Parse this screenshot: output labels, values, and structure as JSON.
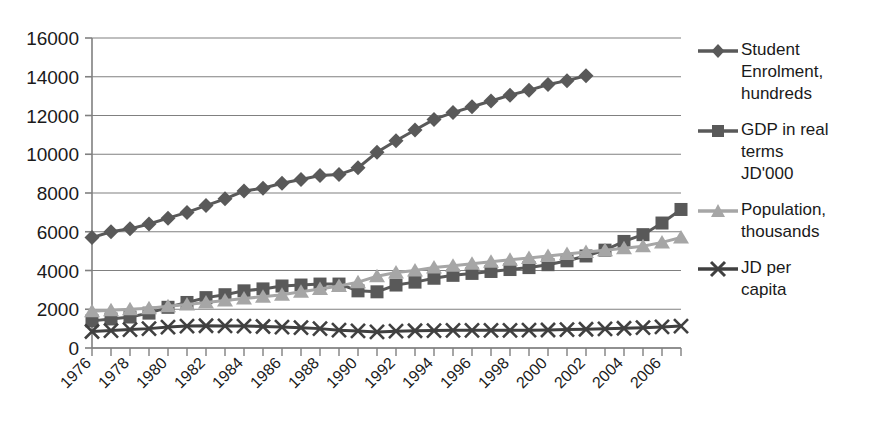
{
  "chart_data": {
    "type": "line",
    "title": "",
    "xlabel": "",
    "ylabel": "",
    "ylim": [
      0,
      16000
    ],
    "ytick_labels": [
      "16000",
      "14000",
      "12000",
      "10000",
      "8000",
      "6000",
      "4000",
      "2000",
      "0"
    ],
    "yticks": [
      16000,
      14000,
      12000,
      10000,
      8000,
      6000,
      4000,
      2000,
      0
    ],
    "grid": "horizontal",
    "legend_position": "right-outside",
    "x": [
      1976,
      1977,
      1978,
      1979,
      1980,
      1981,
      1982,
      1983,
      1984,
      1985,
      1986,
      1987,
      1988,
      1989,
      1990,
      1991,
      1992,
      1993,
      1994,
      1995,
      1996,
      1997,
      1998,
      1999,
      2000,
      2001,
      2002,
      2003,
      2004,
      2005,
      2006,
      2007
    ],
    "xtick_labels": [
      "1976",
      "",
      "1978",
      "",
      "1980",
      "",
      "1982",
      "",
      "1984",
      "",
      "1986",
      "",
      "1988",
      "",
      "1990",
      "",
      "1992",
      "",
      "1994",
      "",
      "1996",
      "",
      "1998",
      "",
      "2000",
      "",
      "2002",
      "",
      "2004",
      "",
      "2006",
      ""
    ],
    "xtick_labels_visible": [
      "1976",
      "1978",
      "1980",
      "1982",
      "1984",
      "1986",
      "1988",
      "1990",
      "1992",
      "1994",
      "1996",
      "1998",
      "2000",
      "2002",
      "2004",
      "2006"
    ],
    "xtick_rotation": -45,
    "series": [
      {
        "name": "Student Enrolment, hundreds",
        "label": "Student\nEnrolment,\nhundreds",
        "marker": "diamond",
        "color": "#595959",
        "values": [
          5700,
          6000,
          6150,
          6400,
          6700,
          7000,
          7350,
          7700,
          8100,
          8250,
          8500,
          8700,
          8900,
          8950,
          9300,
          10100,
          10700,
          11250,
          11800,
          12150,
          12450,
          12750,
          13050,
          13300,
          13600,
          13800,
          14050,
          null,
          null,
          null,
          null,
          null
        ]
      },
      {
        "name": "GDP in real terms JD'000",
        "label": "GDP in real\nterms\nJD'000",
        "marker": "square",
        "color": "#595959",
        "values": [
          1400,
          1500,
          1600,
          1800,
          2100,
          2350,
          2600,
          2750,
          2950,
          3050,
          3200,
          3250,
          3300,
          3300,
          2950,
          2900,
          3250,
          3400,
          3600,
          3750,
          3850,
          3950,
          4050,
          4150,
          4300,
          4500,
          4750,
          5050,
          5500,
          5850,
          6450,
          7150
        ]
      },
      {
        "name": "Population, thousands",
        "label": "Population,\nthousands",
        "marker": "triangle",
        "color": "#a6a6a6",
        "values": [
          1900,
          1950,
          2000,
          2050,
          2150,
          2250,
          2350,
          2450,
          2550,
          2650,
          2750,
          2900,
          3050,
          3200,
          3400,
          3700,
          3900,
          4000,
          4150,
          4250,
          4350,
          4450,
          4550,
          4650,
          4750,
          4850,
          4950,
          5050,
          5150,
          5250,
          5450,
          5700
        ]
      },
      {
        "name": "JD per capita",
        "label": "JD per\ncapita",
        "marker": "x",
        "color": "#404040",
        "values": [
          850,
          900,
          950,
          1000,
          1080,
          1130,
          1150,
          1140,
          1130,
          1110,
          1080,
          1050,
          1000,
          920,
          880,
          830,
          870,
          890,
          900,
          910,
          910,
          910,
          910,
          920,
          930,
          950,
          970,
          990,
          1020,
          1050,
          1090,
          1130
        ]
      }
    ]
  },
  "axes": {
    "axis_color": "#808080",
    "grid_color": "#808080"
  }
}
